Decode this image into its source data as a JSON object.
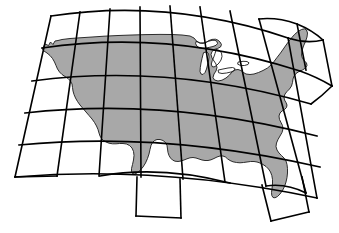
{
  "figure": {
    "background_color": "#ffffff",
    "landmass_fill_color": "#a8a8a8",
    "landmass_outline_color": "#1a1a1a",
    "grid_line_color": "#000000",
    "grid_line_width": "1.6",
    "coast_line_width": "0.9"
  },
  "map_data": {
    "type": "map",
    "region": "Conterminous United States",
    "projection_family": "conic",
    "grid": {
      "columns": 9,
      "rows": 6,
      "cell_shape": "curved quadrilateral",
      "curvature": "arcs bow upward toward the north, meridians fan outward",
      "outline_style": "stepped perimeter following sheet boundaries"
    },
    "features": [
      "Pacific coastline",
      "Puget Sound",
      "Cape Mendocino",
      "Baja / Gulf of California notch",
      "Rio Grande border",
      "Gulf of Mexico coastline",
      "Florida peninsula",
      "Atlantic coastline",
      "Chesapeake Bay",
      "Cape Cod",
      "Maine",
      "Great Lakes",
      "Lake Superior",
      "Lake Michigan",
      "Lake Huron",
      "Lake Erie",
      "Lake Ontario",
      "Canadian border"
    ],
    "extent_notes": {
      "north_edge": "49th parallel arc across top of map",
      "south_edge": "Gulf coast and southern tip of Texas",
      "west_edge": "Pacific coast",
      "east_edge": "Atlantic coast"
    }
  }
}
